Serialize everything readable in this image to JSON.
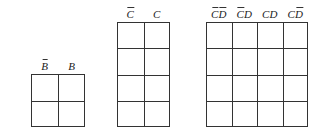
{
  "maps": [
    {
      "id": "two-variable",
      "columns": [
        {
          "parts": [
            {
              "v": "B",
              "bar": true
            }
          ]
        },
        {
          "parts": [
            {
              "v": "B",
              "bar": false
            }
          ]
        }
      ],
      "rows": [
        {
          "parts": [
            {
              "v": "A",
              "bar": true
            }
          ]
        },
        {
          "parts": [
            {
              "v": "A",
              "bar": false
            }
          ]
        }
      ]
    },
    {
      "id": "three-variable",
      "columns": [
        {
          "parts": [
            {
              "v": "C",
              "bar": true
            }
          ]
        },
        {
          "parts": [
            {
              "v": "C",
              "bar": false
            }
          ]
        }
      ],
      "rows": [
        {
          "parts": [
            {
              "v": "A",
              "bar": true
            },
            {
              "v": "B",
              "bar": true
            }
          ]
        },
        {
          "parts": [
            {
              "v": "A",
              "bar": true
            },
            {
              "v": "B",
              "bar": false
            }
          ]
        },
        {
          "parts": [
            {
              "v": "A",
              "bar": false
            },
            {
              "v": "B",
              "bar": false
            }
          ]
        },
        {
          "parts": [
            {
              "v": "A",
              "bar": false
            },
            {
              "v": "B",
              "bar": true
            }
          ]
        }
      ]
    },
    {
      "id": "four-variable",
      "columns": [
        {
          "parts": [
            {
              "v": "C",
              "bar": true
            },
            {
              "v": "D",
              "bar": true
            }
          ]
        },
        {
          "parts": [
            {
              "v": "C",
              "bar": true
            },
            {
              "v": "D",
              "bar": false
            }
          ]
        },
        {
          "parts": [
            {
              "v": "C",
              "bar": false
            },
            {
              "v": "D",
              "bar": false
            }
          ]
        },
        {
          "parts": [
            {
              "v": "C",
              "bar": false
            },
            {
              "v": "D",
              "bar": true
            }
          ]
        }
      ],
      "rows": [
        {
          "parts": [
            {
              "v": "A",
              "bar": true
            },
            {
              "v": "B",
              "bar": true
            }
          ]
        },
        {
          "parts": [
            {
              "v": "A",
              "bar": true
            },
            {
              "v": "B",
              "bar": false
            }
          ]
        },
        {
          "parts": [
            {
              "v": "A",
              "bar": false
            },
            {
              "v": "B",
              "bar": false
            }
          ]
        },
        {
          "parts": [
            {
              "v": "A",
              "bar": false
            },
            {
              "v": "B",
              "bar": true
            }
          ]
        }
      ]
    }
  ],
  "layout": [
    {
      "left": 31,
      "top": 74,
      "width": 54,
      "height": 53
    },
    {
      "left": 117,
      "top": 22,
      "width": 53,
      "height": 105
    },
    {
      "left": 206,
      "top": 22,
      "width": 102,
      "height": 105
    }
  ],
  "colors": {
    "line": "#333333",
    "text": "#222222",
    "background": "#ffffff"
  }
}
